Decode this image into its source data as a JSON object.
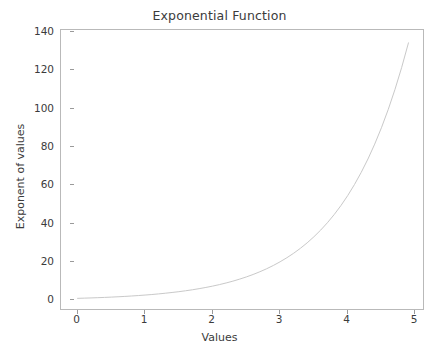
{
  "chart_data": {
    "type": "line",
    "title": "Exponential Function",
    "xlabel": "Values",
    "ylabel": "Exponent of values",
    "xlim": [
      -0.245,
      5.145
    ],
    "ylim": [
      -5.6,
      141.0
    ],
    "xticks": [
      0,
      1,
      2,
      3,
      4,
      5
    ],
    "xtick_labels": [
      "0",
      "1",
      "2",
      "3",
      "4",
      "5"
    ],
    "yticks": [
      0,
      20,
      40,
      60,
      80,
      100,
      120,
      140
    ],
    "ytick_labels": [
      "0",
      "20",
      "40",
      "60",
      "80",
      "100",
      "120",
      "140"
    ],
    "grid": false,
    "legend": null,
    "line_color": "#c9c9c9",
    "line_width": 1.0,
    "series": [
      {
        "name": "exp(x)",
        "x": [
          0.0,
          0.1,
          0.2,
          0.3,
          0.4,
          0.5,
          0.6,
          0.7,
          0.8,
          0.9,
          1.0,
          1.1,
          1.2,
          1.3,
          1.4,
          1.5,
          1.6,
          1.7,
          1.8,
          1.9,
          2.0,
          2.1,
          2.2,
          2.3,
          2.4,
          2.5,
          2.6,
          2.7,
          2.8,
          2.9,
          3.0,
          3.1,
          3.2,
          3.3,
          3.4,
          3.5,
          3.6,
          3.7,
          3.8,
          3.9,
          4.0,
          4.1,
          4.2,
          4.3,
          4.4,
          4.5,
          4.6,
          4.7,
          4.8,
          4.9
        ],
        "y": [
          1.0,
          1.11,
          1.22,
          1.35,
          1.49,
          1.65,
          1.82,
          2.01,
          2.23,
          2.46,
          2.72,
          3.0,
          3.32,
          3.67,
          4.06,
          4.48,
          4.95,
          5.47,
          6.05,
          6.69,
          7.39,
          8.17,
          9.03,
          9.97,
          11.02,
          12.18,
          13.46,
          14.88,
          16.44,
          18.17,
          20.09,
          22.2,
          24.53,
          27.11,
          29.96,
          33.12,
          36.6,
          40.45,
          44.7,
          49.4,
          54.6,
          60.34,
          66.69,
          73.7,
          81.45,
          90.02,
          99.48,
          109.95,
          121.51,
          134.29
        ]
      }
    ]
  }
}
